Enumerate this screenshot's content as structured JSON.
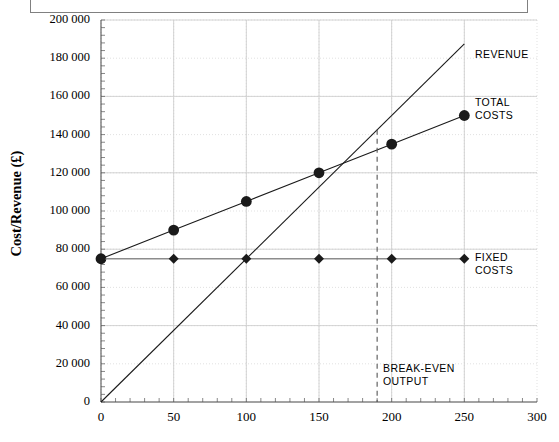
{
  "chart_data": {
    "type": "line",
    "title": "",
    "xlabel": "",
    "ylabel": "Cost/Revenue (£)",
    "xlim": [
      0,
      300
    ],
    "ylim": [
      0,
      200000
    ],
    "grid": true,
    "legend_position": "right-inline-annotations",
    "x_ticks": [
      "0",
      "50",
      "100",
      "150",
      "200",
      "250",
      "300"
    ],
    "x_tick_values": [
      0,
      50,
      100,
      150,
      200,
      250,
      300
    ],
    "y_ticks": [
      "0",
      "20 000",
      "40 000",
      "60 000",
      "80 000",
      "100 000",
      "120 000",
      "140 000",
      "160 000",
      "180 000",
      "200 000"
    ],
    "y_tick_values": [
      0,
      20000,
      40000,
      60000,
      80000,
      100000,
      120000,
      140000,
      160000,
      180000,
      200000
    ],
    "series": [
      {
        "name": "REVENUE",
        "marker": "none",
        "x": [
          0,
          250
        ],
        "values": [
          0,
          187500
        ]
      },
      {
        "name": "TOTAL COSTS",
        "marker": "circle",
        "x": [
          0,
          50,
          100,
          150,
          200,
          250
        ],
        "values": [
          75000,
          90000,
          105000,
          120000,
          135000,
          150000
        ]
      },
      {
        "name": "FIXED COSTS",
        "marker": "diamond",
        "x": [
          0,
          50,
          100,
          150,
          200,
          250
        ],
        "values": [
          75000,
          75000,
          75000,
          75000,
          75000,
          75000
        ]
      }
    ],
    "annotations": [
      {
        "name": "REVENUE",
        "label": "REVENUE"
      },
      {
        "name": "TOTAL COSTS",
        "label": "TOTAL\nCOSTS"
      },
      {
        "name": "FIXED COSTS",
        "label": "FIXED\nCOSTS"
      },
      {
        "name": "BREAK-EVEN OUTPUT",
        "label": "BREAK-EVEN\nOUTPUT",
        "x": 190,
        "y": 142500
      }
    ],
    "breakeven": {
      "output": 190,
      "value": 142500
    }
  },
  "labels": {
    "y_axis_title": "Cost/Revenue (£)",
    "revenue": "REVENUE",
    "total_costs": "TOTAL\nCOSTS",
    "fixed_costs": "FIXED\nCOSTS",
    "breakeven": "BREAK-EVEN\nOUTPUT"
  },
  "colors": {
    "line": "#1a1a1a",
    "grid": "#d9d9d9",
    "axis": "#555555",
    "fixed_costs_line": "#8c8c8c",
    "frame": "#808080",
    "text": "#000000"
  }
}
